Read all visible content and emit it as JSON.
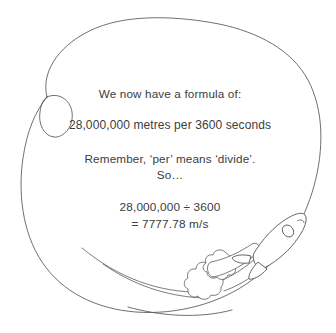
{
  "slide": {
    "name": "speed-formula-slide",
    "background_color": "#ffffff",
    "ink_color": "#3c3c3c"
  },
  "content": {
    "intro_line": "We now have a formula of:",
    "formula_line": "28,000,000 metres per 3600 seconds",
    "remember_line": "Remember, ‘per’ means ‘divide’.",
    "so_line": "So…",
    "calculation_line": "28,000,000 ÷ 3600",
    "result_line": "= 7777.78 m/s"
  },
  "illustration": {
    "circle_label": "hand-drawn-circle",
    "rocket_label": "rocket-icon",
    "exhaust_label": "exhaust-smoke-icon",
    "trail_label": "rocket-trail-icon",
    "stroke_color": "#4a4a4a"
  }
}
